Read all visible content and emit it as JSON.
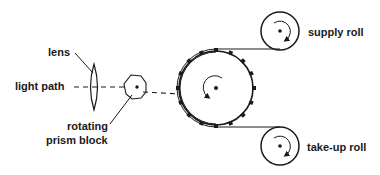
{
  "diagram": {
    "labels": {
      "lens": "lens",
      "light_path": "light path",
      "rotating_prism_line1": "rotating",
      "rotating_prism_line2": "prism block",
      "supply_roll": "supply roll",
      "take_up_roll": "take-up roll"
    },
    "components": [
      {
        "id": "lens",
        "label": "lens",
        "shape": "biconvex-lens"
      },
      {
        "id": "light-path",
        "label": "light path",
        "shape": "dashed-line"
      },
      {
        "id": "prism-block",
        "label": "rotating prism block",
        "shape": "polygon"
      },
      {
        "id": "sprocket-drum",
        "label": "",
        "shape": "toothed-circle",
        "rotation": "counterclockwise"
      },
      {
        "id": "supply-roll",
        "label": "supply roll",
        "shape": "circle",
        "rotation": "clockwise"
      },
      {
        "id": "take-up-roll",
        "label": "take-up roll",
        "shape": "circle",
        "rotation": "clockwise"
      }
    ],
    "colors": {
      "stroke": "#1a1a1a",
      "background": "#ffffff"
    }
  }
}
